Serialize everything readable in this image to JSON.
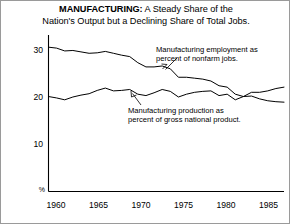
{
  "figure": {
    "title_lines": [
      {
        "strong": "MANUFACTURING:",
        "rest": " A Steady Share of the"
      },
      {
        "strong": "",
        "rest": "Nation's Output but a Declining Share of Total Jobs."
      }
    ],
    "background_color": "#ffffff",
    "line_color": "#000000",
    "border_color": "#9a9a9a"
  },
  "annotations": {
    "employment": {
      "line1": "Manufacturing employment as",
      "line2": "percent of nonfarm jobs."
    },
    "production": {
      "line1": "Manufacturing production as",
      "line2": "percent of gross national product."
    }
  },
  "chart_data": {
    "type": "line",
    "title": "MANUFACTURING: A Steady Share of the Nation's Output but a Declining Share of Total Jobs.",
    "xlabel": "",
    "ylabel": "%",
    "xlim": [
      1959,
      1988
    ],
    "ylim": [
      0,
      33
    ],
    "grid": false,
    "legend": "annotations-inline",
    "y_ticks": [
      10,
      20,
      30
    ],
    "y_tick_labels": [
      "10",
      "20",
      "30"
    ],
    "y_axis_unit_label": "%",
    "x_ticks": [
      1960,
      1965,
      1970,
      1975,
      1980,
      1985
    ],
    "x_tick_labels": [
      "1960",
      "1965",
      "1970",
      "1975",
      "1980",
      "1985"
    ],
    "series": [
      {
        "name": "Manufacturing employment as percent of nonfarm jobs.",
        "x": [
          1959,
          1960,
          1961,
          1962,
          1963,
          1964,
          1965,
          1966,
          1967,
          1968,
          1969,
          1970,
          1971,
          1972,
          1973,
          1974,
          1975,
          1976,
          1977,
          1978,
          1979,
          1980,
          1981,
          1982,
          1983,
          1984,
          1985,
          1986,
          1987,
          1988
        ],
        "values": [
          30.6,
          30.4,
          29.8,
          29.9,
          29.6,
          29.3,
          29.4,
          29.7,
          29.3,
          28.9,
          28.6,
          27.3,
          26.4,
          26.4,
          26.6,
          26.0,
          24.2,
          24.2,
          24.0,
          23.8,
          23.4,
          22.4,
          22.1,
          20.6,
          20.1,
          20.2,
          19.6,
          19.2,
          19.0,
          18.9
        ]
      },
      {
        "name": "Manufacturing production as percent of gross national product.",
        "x": [
          1959,
          1960,
          1961,
          1962,
          1963,
          1964,
          1965,
          1966,
          1967,
          1968,
          1969,
          1970,
          1971,
          1972,
          1973,
          1974,
          1975,
          1976,
          1977,
          1978,
          1979,
          1980,
          1981,
          1982,
          1983,
          1984,
          1985,
          1986,
          1987,
          1988
        ],
        "values": [
          20.1,
          19.8,
          19.4,
          20.0,
          20.4,
          20.7,
          21.4,
          21.9,
          21.3,
          21.4,
          21.6,
          20.6,
          20.3,
          20.9,
          21.6,
          21.2,
          20.0,
          20.6,
          21.0,
          21.2,
          21.3,
          20.3,
          20.6,
          19.4,
          20.1,
          21.0,
          21.0,
          21.3,
          21.8,
          22.1
        ]
      }
    ]
  }
}
